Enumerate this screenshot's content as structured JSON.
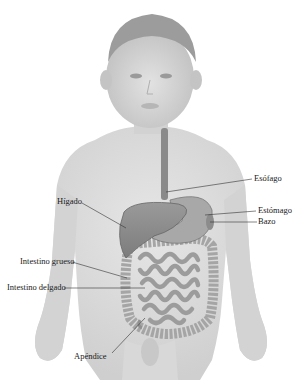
{
  "diagram": {
    "title": "",
    "labels": {
      "esophagus": "Esófago",
      "liver": "Hígado",
      "stomach": "Estómago",
      "spleen": "Bazo",
      "large_intestine": "Intestino grueso",
      "small_intestine": "Intestino delgado",
      "appendix": "Apéndice"
    },
    "colors": {
      "skin": "#d9d9d9",
      "organ": "#8f8f8f",
      "organ_light": "#b4b4b4",
      "line": "#333333",
      "text": "#1a1a1a"
    }
  }
}
